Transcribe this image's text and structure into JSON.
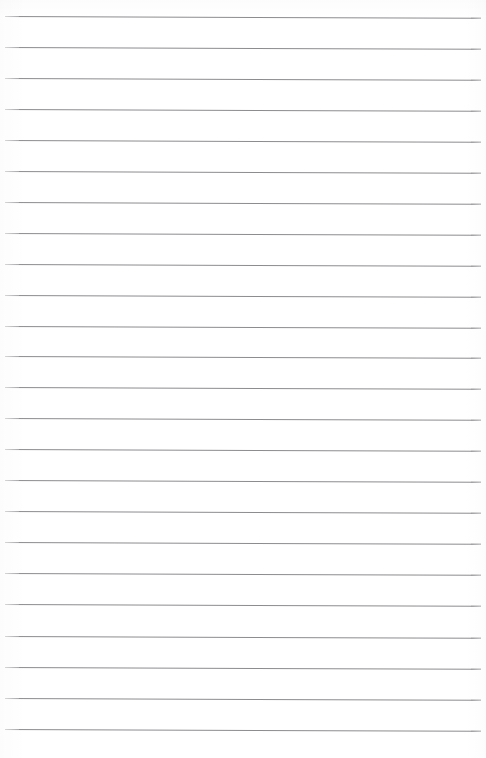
{
  "document": {
    "kind": "lined-paper-scan",
    "title": "Blank lined paper",
    "page_width": 486,
    "page_height": 758,
    "background_color": "#ffffff",
    "written_text": "",
    "margin_text": "",
    "header_text": "",
    "footer_text": "",
    "page_number": ""
  },
  "ruling": {
    "line_color": "#8c8c8f",
    "line_thickness": 1,
    "line_count": 24,
    "first_line_y": 16,
    "line_spacing": 31,
    "line_start_x": 5,
    "line_end_x": 481,
    "scan_tilt_degrees": 0.22,
    "lines": [
      {
        "index": 1,
        "y": 16,
        "x1": 5,
        "x2": 481,
        "tilt": 0.22
      },
      {
        "index": 2,
        "y": 47,
        "x1": 5,
        "x2": 481,
        "tilt": 0.22
      },
      {
        "index": 3,
        "y": 78,
        "x1": 5,
        "x2": 481,
        "tilt": 0.22
      },
      {
        "index": 4,
        "y": 109,
        "x1": 5,
        "x2": 481,
        "tilt": 0.22
      },
      {
        "index": 5,
        "y": 140,
        "x1": 5,
        "x2": 481,
        "tilt": 0.22
      },
      {
        "index": 6,
        "y": 171,
        "x1": 5,
        "x2": 481,
        "tilt": 0.22
      },
      {
        "index": 7,
        "y": 202,
        "x1": 5,
        "x2": 481,
        "tilt": 0.22
      },
      {
        "index": 8,
        "y": 233,
        "x1": 5,
        "x2": 481,
        "tilt": 0.22
      },
      {
        "index": 9,
        "y": 264,
        "x1": 5,
        "x2": 481,
        "tilt": 0.22
      },
      {
        "index": 10,
        "y": 295,
        "x1": 5,
        "x2": 481,
        "tilt": 0.22
      },
      {
        "index": 11,
        "y": 326,
        "x1": 5,
        "x2": 481,
        "tilt": 0.22
      },
      {
        "index": 12,
        "y": 356,
        "x1": 5,
        "x2": 481,
        "tilt": 0.22
      },
      {
        "index": 13,
        "y": 387,
        "x1": 5,
        "x2": 481,
        "tilt": 0.22
      },
      {
        "index": 14,
        "y": 418,
        "x1": 5,
        "x2": 481,
        "tilt": 0.22
      },
      {
        "index": 15,
        "y": 449,
        "x1": 5,
        "x2": 481,
        "tilt": 0.22
      },
      {
        "index": 16,
        "y": 480,
        "x1": 5,
        "x2": 481,
        "tilt": 0.22
      },
      {
        "index": 17,
        "y": 511,
        "x1": 5,
        "x2": 481,
        "tilt": 0.22
      },
      {
        "index": 18,
        "y": 542,
        "x1": 5,
        "x2": 481,
        "tilt": 0.22
      },
      {
        "index": 19,
        "y": 573,
        "x1": 5,
        "x2": 481,
        "tilt": 0.22
      },
      {
        "index": 20,
        "y": 604,
        "x1": 5,
        "x2": 481,
        "tilt": 0.22
      },
      {
        "index": 21,
        "y": 636,
        "x1": 5,
        "x2": 481,
        "tilt": 0.22
      },
      {
        "index": 22,
        "y": 667,
        "x1": 5,
        "x2": 481,
        "tilt": 0.22
      },
      {
        "index": 23,
        "y": 698,
        "x1": 5,
        "x2": 481,
        "tilt": 0.22
      },
      {
        "index": 24,
        "y": 729,
        "x1": 5,
        "x2": 481,
        "tilt": 0.22
      }
    ]
  }
}
